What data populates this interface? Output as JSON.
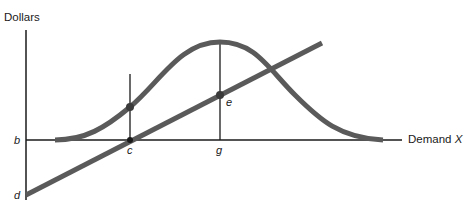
{
  "diagram": {
    "y_axis_label": "Dollars",
    "x_axis_label_prefix": "Demand ",
    "x_axis_label_var": "X",
    "point_labels": {
      "b": "b",
      "c": "c",
      "d": "d",
      "e": "e",
      "g": "g"
    },
    "colors": {
      "curve": "#5a5a5a",
      "axis": "#1a1a1a"
    },
    "elements": [
      {
        "name": "bell-curve",
        "description": "Bell-shaped curve starting on horizontal axis, peaking above g, returning to axis"
      },
      {
        "name": "straight-line",
        "description": "Upward sloping line starting at d below axis, crossing axis at c, passing through e"
      },
      {
        "name": "vertical-c",
        "description": "Vertical line at c intersecting the curve"
      },
      {
        "name": "vertical-g",
        "description": "Vertical line at g from axis to curve peak"
      }
    ]
  }
}
